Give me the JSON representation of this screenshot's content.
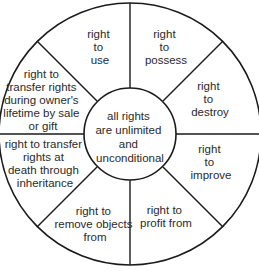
{
  "diagram": {
    "type": "wheel",
    "title": "",
    "colors": {
      "stroke": "#1a1a1a",
      "fill": "#ffffff",
      "text": "#2a2a2a"
    },
    "center": {
      "lines": [
        "all rights",
        "are unlimited",
        "and",
        "unconditional"
      ]
    },
    "sectors": [
      {
        "id": "use",
        "lines": [
          "right",
          "to",
          "use"
        ]
      },
      {
        "id": "possess",
        "lines": [
          "right",
          "to",
          "possess"
        ]
      },
      {
        "id": "destroy",
        "lines": [
          "right",
          "to",
          "destroy"
        ]
      },
      {
        "id": "improve",
        "lines": [
          "right",
          "to",
          "improve"
        ]
      },
      {
        "id": "profit",
        "lines": [
          "right to",
          "profit from"
        ]
      },
      {
        "id": "remove",
        "lines": [
          "right to",
          "remove objects",
          "from"
        ]
      },
      {
        "id": "transfer-death",
        "lines": [
          "right to transfer",
          "rights at",
          "death through",
          "inheritance"
        ]
      },
      {
        "id": "transfer-lifetime",
        "lines": [
          "right to",
          "transfer rights",
          "during owner's",
          "lifetime by sale",
          "or gift"
        ]
      }
    ]
  }
}
